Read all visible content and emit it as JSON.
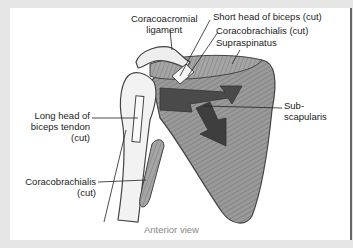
{
  "diagram": {
    "title": "Anterior view",
    "labels": {
      "coracoacromial": [
        "Coracoacromial",
        "ligament"
      ],
      "short_head": "Short head of biceps (cut)",
      "coracobrachialis_top": "Coracobrachialis (cut)",
      "supraspinatus": "Supraspinatus",
      "subscapularis": [
        "Sub-",
        "scapularis"
      ],
      "long_head": [
        "Long head of",
        "biceps tendon",
        "(cut)"
      ],
      "coracobrachialis_bottom": [
        "Coracobrachialis",
        "(cut)"
      ]
    },
    "colors": {
      "background": "#e6e6e6",
      "panel": "#ffffff",
      "muscle": "#8a8a8a",
      "muscle_dark": "#4a4a4a",
      "bone": "#f2f2f2",
      "outline": "#555555",
      "text": "#222222",
      "caption": "#888888"
    }
  }
}
